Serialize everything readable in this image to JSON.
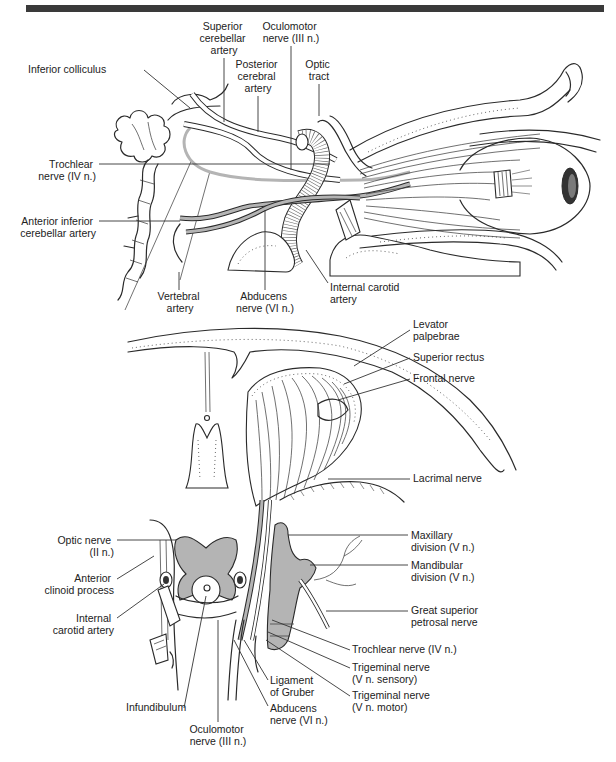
{
  "figure": {
    "header_bar_color": "#3a3a3a",
    "fill_gray": "#b4b4b4",
    "top_panel": {
      "labels": {
        "superior_cerebellar_artery": [
          "Superior",
          "cerebellar",
          "artery"
        ],
        "oculomotor_nerve": [
          "Oculomotor",
          "nerve (III n.)"
        ],
        "inferior_colliculus": [
          "Inferior colliculus"
        ],
        "posterior_cerebral_artery": [
          "Posterior",
          "cerebral",
          "artery"
        ],
        "optic_tract": [
          "Optic",
          "tract"
        ],
        "trochlear_nerve": [
          "Trochlear",
          "nerve (IV n.)"
        ],
        "anterior_inferior_cerebellar_artery": [
          "Anterior inferior",
          "cerebellar artery"
        ],
        "vertebral_artery": [
          "Vertebral",
          "artery"
        ],
        "abducens_nerve": [
          "Abducens",
          "nerve (VI n.)"
        ],
        "internal_carotid_artery": [
          "Internal carotid",
          "artery"
        ]
      }
    },
    "bottom_panel": {
      "labels": {
        "levator_palpebrae": [
          "Levator",
          "palpebrae"
        ],
        "superior_rectus": [
          "Superior rectus"
        ],
        "frontal_nerve": [
          "Frontal nerve"
        ],
        "lacrimal_nerve": [
          "Lacrimal nerve"
        ],
        "maxillary_division": [
          "Maxillary",
          "division (V n.)"
        ],
        "mandibular_division": [
          "Mandibular",
          "division (V n.)"
        ],
        "great_superior_petrosal_nerve": [
          "Great superior",
          "petrosal nerve"
        ],
        "trochlear_nerve": [
          "Trochlear nerve (IV n.)"
        ],
        "trigeminal_sensory": [
          "Trigeminal nerve",
          "(V n. sensory)"
        ],
        "trigeminal_motor": [
          "Trigeminal nerve",
          "(V n. motor)"
        ],
        "optic_nerve": [
          "Optic nerve",
          "(II n.)"
        ],
        "anterior_clinoid_process": [
          "Anterior",
          "clinoid process"
        ],
        "internal_carotid_artery": [
          "Internal",
          "carotid artery"
        ],
        "ligament_of_gruber": [
          "Ligament",
          "of Gruber"
        ],
        "abducens_nerve": [
          "Abducens",
          "nerve (VI n.)"
        ],
        "infundibulum": [
          "Infundibulum"
        ],
        "oculomotor_nerve": [
          "Oculomotor",
          "nerve (III n.)"
        ]
      }
    }
  }
}
